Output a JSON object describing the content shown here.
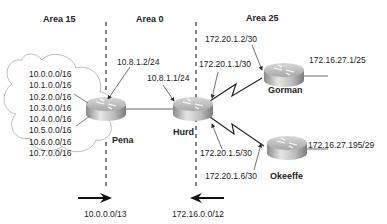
{
  "areas": [
    {
      "label": "Area 15"
    },
    {
      "label": "Area 0"
    },
    {
      "label": "Area 25"
    }
  ],
  "routers": {
    "pena": {
      "name": "Pena"
    },
    "hurd": {
      "name": "Hurd"
    },
    "gorman": {
      "name": "Gorman"
    },
    "okeeffe": {
      "name": "Okeeffe"
    }
  },
  "cloud_networks": [
    "10.0.0.0/16",
    "10.1.0.0/16",
    "10.2.0.0/16",
    "10.3.0.0/16",
    "10.4.0.0/16",
    "10.5.0.0/16",
    "10.6.0.0/16",
    "10.7.0.0/16"
  ],
  "interfaces": {
    "pena_eth": "10.8.1.2/24",
    "hurd_eth": "10.8.1.1/24",
    "hurd_s_gorman": "172.20.1.1/30",
    "gorman_s": "172.20.1.2/30",
    "hurd_s_okeeffe": "172.20.1.5/30",
    "okeeffe_s": "172.20.1.6/30",
    "gorman_lan": "172.16.27.1/25",
    "okeeffe_lan": "172.16.27.195/29"
  },
  "summaries": {
    "area15_summary": "10.0.0.0/13",
    "area25_summary": "172.16.0.0/12"
  }
}
